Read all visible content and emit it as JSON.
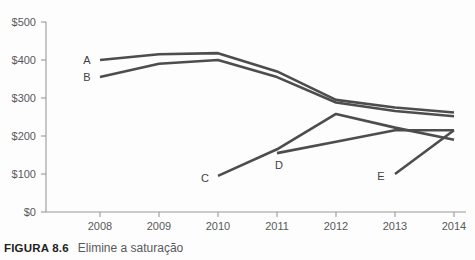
{
  "caption": {
    "label": "FIGURA 8.6",
    "text": "Elimine a saturação"
  },
  "chart_data": {
    "type": "line",
    "title": "",
    "xlabel": "",
    "ylabel": "",
    "x": [
      2008,
      2009,
      2010,
      2011,
      2012,
      2013,
      2014
    ],
    "categories": [
      "2008",
      "2009",
      "2010",
      "2011",
      "2012",
      "2013",
      "2014"
    ],
    "xtick_labels": [
      "2008",
      "2009",
      "2010",
      "2011",
      "2012",
      "2013",
      "2014"
    ],
    "ytick_labels": [
      "$0",
      "$100",
      "$200",
      "$300",
      "$400",
      "$500"
    ],
    "ytick_values": [
      0,
      100,
      200,
      300,
      400,
      500
    ],
    "ylim": [
      0,
      500
    ],
    "xlim": [
      2008,
      2014
    ],
    "grid": false,
    "legend_position": "inline-left-of-line-start",
    "line_color": "#4d4d4d",
    "axis_color": "#9a9a9a",
    "tick_text_color": "#58595b",
    "series": [
      {
        "name": "A",
        "label": "A",
        "x": [
          2008,
          2009,
          2010,
          2011,
          2012,
          2013,
          2014
        ],
        "values": [
          400,
          415,
          418,
          370,
          295,
          275,
          262
        ]
      },
      {
        "name": "B",
        "label": "B",
        "x": [
          2008,
          2009,
          2010,
          2011,
          2012,
          2013,
          2014
        ],
        "values": [
          355,
          390,
          400,
          355,
          288,
          266,
          252
        ]
      },
      {
        "name": "C",
        "label": "C",
        "x": [
          2010,
          2011,
          2012,
          2013,
          2014
        ],
        "values": [
          95,
          165,
          258,
          222,
          190
        ]
      },
      {
        "name": "D",
        "label": "D",
        "x": [
          2011,
          2012,
          2013,
          2014
        ],
        "values": [
          155,
          185,
          215,
          215
        ]
      },
      {
        "name": "E",
        "label": "E",
        "x": [
          2013,
          2014
        ],
        "values": [
          100,
          215
        ]
      }
    ],
    "series_label_points": [
      {
        "name": "A",
        "label": "A",
        "x": 2008,
        "y": 400
      },
      {
        "name": "B",
        "label": "B",
        "x": 2008,
        "y": 355
      },
      {
        "name": "C",
        "label": "C",
        "x": 2010,
        "y": 95
      },
      {
        "name": "D",
        "label": "D",
        "x": 2011,
        "y": 155
      },
      {
        "name": "E",
        "label": "E",
        "x": 2013,
        "y": 100
      }
    ]
  }
}
